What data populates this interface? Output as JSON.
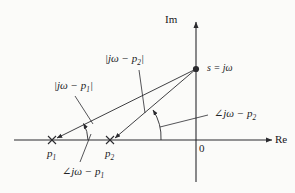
{
  "figure": {
    "kind": "s-plane pole diagram",
    "background_color": "#fbfbf9",
    "ink_color": "#2a2a2e",
    "axes": {
      "imaginary_label": "Im",
      "real_label": "Re",
      "origin_label": "0",
      "origin_px": {
        "x": 196,
        "y": 140
      }
    },
    "point": {
      "label": "s = jω",
      "marker": "filled-dot",
      "px": {
        "x": 196,
        "y": 69
      }
    },
    "poles": [
      {
        "id": "p1",
        "label": "p",
        "subscript": "1",
        "marker": "x",
        "px": {
          "x": 52,
          "y": 140
        }
      },
      {
        "id": "p2",
        "label": "p",
        "subscript": "2",
        "marker": "x",
        "px": {
          "x": 110,
          "y": 140
        }
      }
    ],
    "magnitude_labels": [
      {
        "id": "mag-p1",
        "text": "|jω − p",
        "subscript": "1",
        "suffix": "|",
        "px": {
          "x": 54,
          "y": 86
        }
      },
      {
        "id": "mag-p2",
        "text": "|jω − p",
        "subscript": "2",
        "suffix": "|",
        "px": {
          "x": 105,
          "y": 59
        }
      }
    ],
    "angle_labels": [
      {
        "id": "ang-p1",
        "angle_symbol": "∠",
        "text": "jω − p",
        "subscript": "1",
        "px": {
          "x": 62,
          "y": 170
        }
      },
      {
        "id": "ang-p2",
        "angle_symbol": "∠",
        "text": "jω − p",
        "subscript": "2",
        "px": {
          "x": 214,
          "y": 113
        }
      }
    ]
  }
}
